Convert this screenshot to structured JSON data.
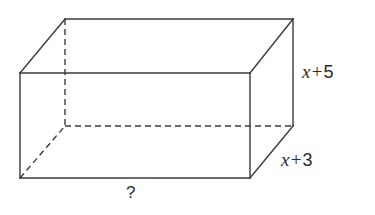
{
  "figure": {
    "type": "rectangular-prism-diagram",
    "background_color": "#ffffff",
    "stroke_color": "#3a3a3a",
    "text_color": "#2b2b2b",
    "stroke_width": 1.4,
    "dash_pattern": "6 4"
  },
  "labels": {
    "height": {
      "full_text": "x + 5",
      "variable": "x",
      "operator": "+",
      "number": "5",
      "edge": "vertical-right-front"
    },
    "depth": {
      "full_text": "x + 3",
      "variable": "x",
      "operator": "+",
      "number": "3",
      "edge": "diagonal-bottom-right"
    },
    "unknown": {
      "full_text": "?",
      "edge": "bottom-front"
    }
  },
  "geometry": {
    "front_face": {
      "top_left": [
        20,
        73
      ],
      "top_right": [
        250,
        73
      ],
      "bottom_right": [
        250,
        178
      ],
      "bottom_left": [
        20,
        178
      ]
    },
    "back_face": {
      "top_left": [
        65,
        19
      ],
      "top_right": [
        293,
        19
      ],
      "bottom_right": [
        293,
        126
      ],
      "bottom_left": [
        65,
        126
      ]
    },
    "hidden_edges": [
      "back-left-vertical",
      "back-bottom-horizontal",
      "bottom-left-diagonal"
    ]
  }
}
